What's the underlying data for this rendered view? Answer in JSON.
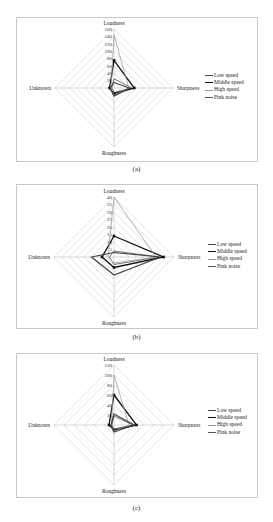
{
  "chart_data": [
    {
      "type": "radar",
      "panel": "(a)",
      "axes": [
        "Loudness",
        "Sharpness",
        "Roughness",
        "Unknown"
      ],
      "radial_ticks": [
        20,
        40,
        60,
        80,
        100,
        120,
        140,
        160
      ],
      "rmax": 160,
      "series": [
        {
          "name": "Low speed",
          "values": [
            25,
            48,
            12,
            6
          ]
        },
        {
          "name": "Middle speed",
          "values": [
            75,
            55,
            15,
            12
          ]
        },
        {
          "name": "High speed",
          "values": [
            145,
            40,
            20,
            8
          ]
        },
        {
          "name": "Pink noise",
          "values": [
            15,
            42,
            22,
            10
          ]
        }
      ],
      "legend_position": "right"
    },
    {
      "type": "radar",
      "panel": "(b)",
      "axes": [
        "Loudness",
        "Sharpness",
        "Roughness",
        "Unknown"
      ],
      "radial_ticks": [
        5,
        10,
        15,
        20,
        25,
        30,
        35,
        40
      ],
      "rmax": 40,
      "series": [
        {
          "name": "Low speed",
          "values": [
            4,
            30,
            5,
            3
          ]
        },
        {
          "name": "Middle speed",
          "values": [
            14,
            33,
            7,
            8
          ]
        },
        {
          "name": "High speed",
          "values": [
            40,
            28,
            4,
            4
          ]
        },
        {
          "name": "Pink noise",
          "values": [
            3,
            31,
            12,
            15
          ]
        }
      ],
      "legend_position": "right"
    },
    {
      "type": "radar",
      "panel": "(c)",
      "axes": [
        "Loudness",
        "Sharpness",
        "Roughness",
        "Unknown"
      ],
      "radial_ticks": [
        20,
        40,
        60,
        80,
        100,
        120
      ],
      "rmax": 120,
      "series": [
        {
          "name": "Low speed",
          "values": [
            18,
            38,
            8,
            4
          ]
        },
        {
          "name": "Middle speed",
          "values": [
            60,
            45,
            10,
            10
          ]
        },
        {
          "name": "High speed",
          "values": [
            100,
            30,
            12,
            5
          ]
        },
        {
          "name": "Pink noise",
          "values": [
            22,
            40,
            14,
            6
          ]
        }
      ],
      "legend_position": "right"
    }
  ],
  "captions": [
    "(a)",
    "(b)",
    "(c)"
  ],
  "legend": [
    "Low speed",
    "Middle speed",
    "High speed",
    "Pink noise"
  ]
}
